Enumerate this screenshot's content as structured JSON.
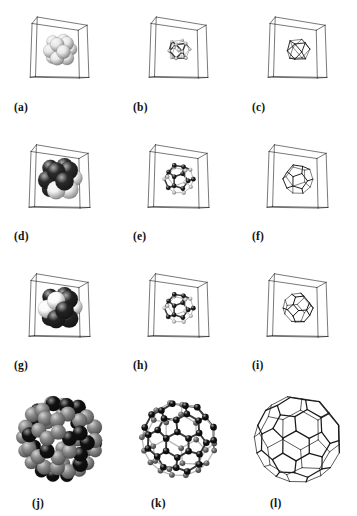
{
  "figure": {
    "title": "",
    "background_color": "#ffffff",
    "ink_color": "#1a1a1a",
    "rows": 4,
    "columns": 3,
    "column_kinds": [
      "space-filling",
      "ball-and-stick",
      "polyhedron-wireframe"
    ]
  },
  "panels": [
    {
      "label": "(a)",
      "kind": "space-filling",
      "box": true,
      "sphere_count": 13,
      "sphere_colors": [
        "#e8e8e8"
      ],
      "sphere_style": "light-gray-shaded",
      "scale": "small"
    },
    {
      "label": "(b)",
      "kind": "ball-and-stick",
      "box": true,
      "sphere_count": 13,
      "sphere_colors": [
        "#d0d0d0"
      ],
      "sphere_style": "light-gray-shaded",
      "scale": "small"
    },
    {
      "label": "(c)",
      "kind": "polyhedron-wireframe",
      "box": true,
      "polyhedron": "cuboctahedron",
      "line_color": "#151515",
      "scale": "small"
    },
    {
      "label": "(d)",
      "kind": "space-filling",
      "box": true,
      "sphere_count": 13,
      "sphere_colors": [
        "#2a2a2a",
        "#f2f2f2"
      ],
      "sphere_style": "dark-glossy",
      "scale": "medium"
    },
    {
      "label": "(e)",
      "kind": "ball-and-stick",
      "box": true,
      "sphere_count": 20,
      "sphere_colors": [
        "#1e1e1e",
        "#cfcfcf"
      ],
      "sphere_style": "dark-glossy",
      "scale": "medium"
    },
    {
      "label": "(f)",
      "kind": "polyhedron-wireframe",
      "box": true,
      "polyhedron": "pentagonal-dodecahedron",
      "line_color": "#222222",
      "scale": "medium"
    },
    {
      "label": "(g)",
      "kind": "space-filling",
      "box": true,
      "sphere_count": 19,
      "sphere_colors": [
        "#232323",
        "#fbfbfb"
      ],
      "sphere_style": "dark-and-white-mixed",
      "scale": "medium"
    },
    {
      "label": "(h)",
      "kind": "ball-and-stick",
      "box": true,
      "sphere_count": 24,
      "sphere_colors": [
        "#1c1c1c",
        "#d8d8d8"
      ],
      "sphere_style": "dark-glossy",
      "scale": "medium"
    },
    {
      "label": "(i)",
      "kind": "polyhedron-wireframe",
      "box": true,
      "polyhedron": "rhombic-truncated-octahedron",
      "line_color": "#151515",
      "scale": "medium"
    },
    {
      "label": "(j)",
      "kind": "space-filling",
      "box": false,
      "sphere_count": 60,
      "sphere_colors": [
        "#8a8a8a",
        "#111111"
      ],
      "sphere_style": "gray-and-black-cage",
      "scale": "large"
    },
    {
      "label": "(k)",
      "kind": "ball-and-stick",
      "box": false,
      "sphere_count": 60,
      "sphere_colors": [
        "#111111",
        "#6e6e6e"
      ],
      "sphere_style": "fullerene-cage",
      "scale": "large"
    },
    {
      "label": "(l)",
      "kind": "polyhedron-wireframe",
      "box": false,
      "polyhedron": "truncated-icosahedron",
      "line_color": "#1a1a1a",
      "scale": "large"
    }
  ]
}
